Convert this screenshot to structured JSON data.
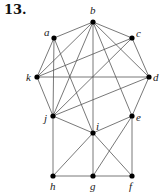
{
  "problem_number": "13.",
  "graph": {
    "nodes": [
      {
        "id": "a",
        "x": 54,
        "y": 38,
        "lx": 44,
        "ly": 36
      },
      {
        "id": "b",
        "x": 93,
        "y": 22,
        "lx": 90,
        "ly": 14
      },
      {
        "id": "c",
        "x": 132,
        "y": 38,
        "lx": 136,
        "ly": 37
      },
      {
        "id": "d",
        "x": 149,
        "y": 77,
        "lx": 153,
        "ly": 81
      },
      {
        "id": "k",
        "x": 37,
        "y": 77,
        "lx": 26,
        "ly": 81
      },
      {
        "id": "j",
        "x": 53,
        "y": 116,
        "lx": 44,
        "ly": 122
      },
      {
        "id": "i",
        "x": 93,
        "y": 133,
        "lx": 96,
        "ly": 130
      },
      {
        "id": "e",
        "x": 132,
        "y": 116,
        "lx": 136,
        "ly": 121
      },
      {
        "id": "h",
        "x": 53,
        "y": 176,
        "lx": 50,
        "ly": 190
      },
      {
        "id": "g",
        "x": 93,
        "y": 176,
        "lx": 90,
        "ly": 190
      },
      {
        "id": "f",
        "x": 132,
        "y": 176,
        "lx": 129,
        "ly": 190
      }
    ],
    "edges": [
      [
        "a",
        "b"
      ],
      [
        "b",
        "c"
      ],
      [
        "c",
        "d"
      ],
      [
        "a",
        "k"
      ],
      [
        "k",
        "j"
      ],
      [
        "d",
        "e"
      ],
      [
        "a",
        "j"
      ],
      [
        "a",
        "i"
      ],
      [
        "b",
        "k"
      ],
      [
        "b",
        "j"
      ],
      [
        "b",
        "i"
      ],
      [
        "b",
        "e"
      ],
      [
        "b",
        "d"
      ],
      [
        "c",
        "k"
      ],
      [
        "c",
        "j"
      ],
      [
        "k",
        "d"
      ],
      [
        "d",
        "j"
      ],
      [
        "j",
        "h"
      ],
      [
        "j",
        "i"
      ],
      [
        "i",
        "e"
      ],
      [
        "i",
        "h"
      ],
      [
        "i",
        "g"
      ],
      [
        "i",
        "f"
      ],
      [
        "e",
        "f"
      ],
      [
        "e",
        "g"
      ],
      [
        "h",
        "g"
      ],
      [
        "g",
        "f"
      ]
    ]
  }
}
